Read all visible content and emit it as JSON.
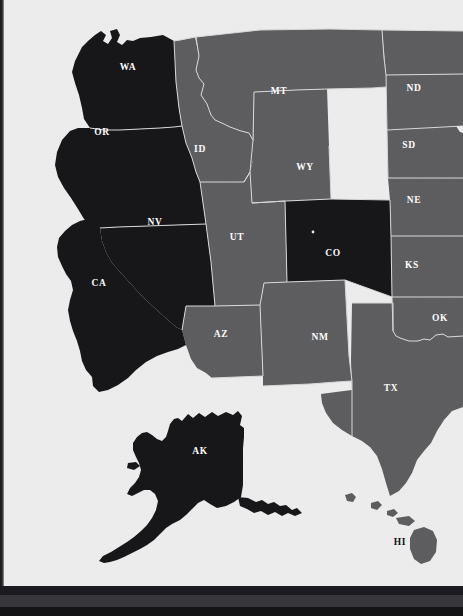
{
  "document": {
    "kind": "printed-map-page",
    "title": "United States state map (western view)",
    "page_background": "#ededee",
    "binding_strip_color": "#17171a",
    "bottom_bar_color": "#17171a"
  },
  "map": {
    "highlight_color": "#171719",
    "plain_color": "#5e5e60",
    "border_color": "#d9d9da",
    "ocean_color": "#ededee",
    "legend_note": "",
    "states": [
      {
        "code": "WA",
        "name": "Washington",
        "highlighted": true,
        "label_x": 128,
        "label_y": 70,
        "label_on_light": false
      },
      {
        "code": "OR",
        "name": "Oregon",
        "highlighted": true,
        "label_x": 102,
        "label_y": 135,
        "label_on_light": false
      },
      {
        "code": "CA",
        "name": "California",
        "highlighted": true,
        "label_x": 99,
        "label_y": 286,
        "label_on_light": false
      },
      {
        "code": "NV",
        "name": "Nevada",
        "highlighted": true,
        "label_x": 155,
        "label_y": 225,
        "label_on_light": false
      },
      {
        "code": "ID",
        "name": "Idaho",
        "highlighted": false,
        "label_x": 200,
        "label_y": 152,
        "label_on_light": false
      },
      {
        "code": "MT",
        "name": "Montana",
        "highlighted": false,
        "label_x": 279,
        "label_y": 94,
        "label_on_light": false
      },
      {
        "code": "WY",
        "name": "Wyoming",
        "highlighted": false,
        "label_x": 305,
        "label_y": 170,
        "label_on_light": false
      },
      {
        "code": "UT",
        "name": "Utah",
        "highlighted": false,
        "label_x": 237,
        "label_y": 240,
        "label_on_light": false
      },
      {
        "code": "CO",
        "name": "Colorado",
        "highlighted": true,
        "label_x": 333,
        "label_y": 256,
        "label_on_light": false
      },
      {
        "code": "AZ",
        "name": "Arizona",
        "highlighted": false,
        "label_x": 221,
        "label_y": 337,
        "label_on_light": false
      },
      {
        "code": "NM",
        "name": "New Mexico",
        "highlighted": false,
        "label_x": 320,
        "label_y": 340,
        "label_on_light": false
      },
      {
        "code": "ND",
        "name": "North Dakota",
        "highlighted": false,
        "label_x": 414,
        "label_y": 91,
        "label_on_light": false
      },
      {
        "code": "SD",
        "name": "South Dakota",
        "highlighted": false,
        "label_x": 409,
        "label_y": 148,
        "label_on_light": false
      },
      {
        "code": "NE",
        "name": "Nebraska",
        "highlighted": false,
        "label_x": 414,
        "label_y": 203,
        "label_on_light": false
      },
      {
        "code": "KS",
        "name": "Kansas",
        "highlighted": false,
        "label_x": 412,
        "label_y": 268,
        "label_on_light": false
      },
      {
        "code": "OK",
        "name": "Oklahoma",
        "highlighted": false,
        "label_x": 440,
        "label_y": 321,
        "label_on_light": false
      },
      {
        "code": "TX",
        "name": "Texas",
        "highlighted": false,
        "label_x": 391,
        "label_y": 391,
        "label_on_light": false
      },
      {
        "code": "AK",
        "name": "Alaska",
        "highlighted": true,
        "label_x": 200,
        "label_y": 454,
        "label_on_light": false
      },
      {
        "code": "HI",
        "name": "Hawaii",
        "highlighted": false,
        "label_x": 400,
        "label_y": 545,
        "label_on_light": true
      }
    ],
    "highlighted_codes": [
      "WA",
      "OR",
      "CA",
      "NV",
      "CO",
      "AK"
    ],
    "plain_codes": [
      "ID",
      "MT",
      "WY",
      "UT",
      "AZ",
      "NM",
      "ND",
      "SD",
      "NE",
      "KS",
      "OK",
      "TX",
      "HI"
    ],
    "marker_dots": [
      {
        "label": "",
        "x": 313,
        "y": 232
      }
    ]
  }
}
